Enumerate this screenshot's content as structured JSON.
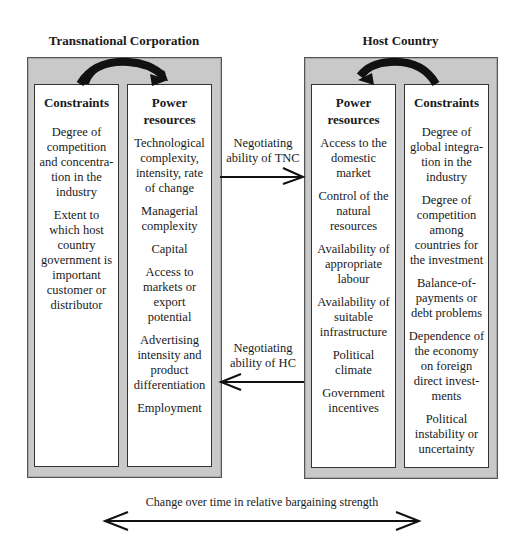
{
  "left_panel": {
    "title": "Transnational Corporation",
    "constraints": {
      "header": "Constraints",
      "items": [
        "Degree of competition and concentra-tion in the industry",
        "Extent to which host country government is important customer or distributor"
      ]
    },
    "power_resources": {
      "header": "Power resources",
      "items": [
        "Technological complexity, intensity, rate of change",
        "Managerial complexity",
        "Capital",
        "Access to markets or export potential",
        "Advertising intensity and product differentiation",
        "Employment"
      ]
    }
  },
  "right_panel": {
    "title": "Host Country",
    "power_resources": {
      "header": "Power resources",
      "items": [
        "Access to the domestic market",
        "Control of the natural resources",
        "Availability of appropriate labour",
        "Availability of suitable infrastructure",
        "Political climate",
        "Government incentives"
      ]
    },
    "constraints": {
      "header": "Constraints",
      "items": [
        "Degree of global integra-tion in the industry",
        "Degree of competition among countries for the investment",
        "Balance-of-payments or debt problems",
        "Dependence of the economy on foreign direct invest-ments",
        "Political instability or uncertainty"
      ]
    }
  },
  "arrows": {
    "tnc_to_hc": "Negotiating ability of TNC",
    "hc_to_tnc": "Negotiating ability of HC"
  },
  "bottom": {
    "label": "Change over time in relative bargaining strength"
  },
  "colors": {
    "panel_fill": "#c9c9c9",
    "box_fill": "#ffffff",
    "ink": "#1a1a1a"
  }
}
